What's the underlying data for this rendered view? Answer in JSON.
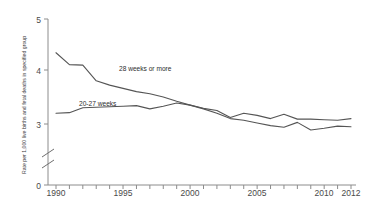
{
  "chart_data": {
    "type": "line",
    "title": "",
    "subtitle": "",
    "xlabel": "",
    "ylabel": "Rate per 1,000 live births and fetal deaths in specified group",
    "xlim": [
      1989,
      2012.6
    ],
    "ylim": [
      2.55,
      5.0
    ],
    "y_axis_break": true,
    "y_axis_break_between": [
      0,
      3
    ],
    "grid": false,
    "legend_position": "inline-annotations",
    "x_tick_labels": [
      "1990",
      "1995",
      "2000",
      "2005",
      "2010",
      "2012"
    ],
    "x_tick_values": [
      1990,
      1995,
      2000,
      2005,
      2010,
      2012
    ],
    "x_minor_ticks": [
      1989,
      1990,
      1991,
      1992,
      1993,
      1994,
      1995,
      1996,
      1997,
      1998,
      1999,
      2000,
      2001,
      2002,
      2003,
      2004,
      2005,
      2006,
      2007,
      2008,
      2009,
      2010,
      2011,
      2012
    ],
    "y_tick_labels": [
      "0",
      "3",
      "4",
      "5"
    ],
    "y_tick_values": [
      0,
      3,
      4,
      5
    ],
    "x": [
      1990,
      1991,
      1992,
      1993,
      1994,
      1995,
      1996,
      1997,
      1998,
      1999,
      2000,
      2001,
      2002,
      2003,
      2004,
      2005,
      2006,
      2007,
      2008,
      2009,
      2010,
      2011,
      2012
    ],
    "series": [
      {
        "name": "28 weeks or more",
        "label": "28 weeks or more",
        "color": "#555555",
        "values": [
          4.32,
          4.1,
          4.09,
          3.8,
          3.72,
          3.66,
          3.6,
          3.56,
          3.5,
          3.42,
          3.35,
          3.28,
          3.2,
          3.1,
          3.07,
          3.02,
          2.97,
          2.94,
          3.03,
          2.89,
          2.92,
          2.96,
          2.95
        ]
      },
      {
        "name": "20-27 weeks",
        "label": "20-27 weeks",
        "color": "#555555",
        "values": [
          3.2,
          3.21,
          3.3,
          3.31,
          3.32,
          3.33,
          3.34,
          3.28,
          3.33,
          3.39,
          3.35,
          3.29,
          3.25,
          3.12,
          3.2,
          3.16,
          3.1,
          3.18,
          3.09,
          3.09,
          3.08,
          3.07,
          3.1
        ]
      }
    ],
    "annotations": [
      {
        "text": "28 weeks or more",
        "x_px": 119,
        "y_px": 71
      },
      {
        "text": "20-27 weeks",
        "x_px": 79,
        "y_px": 106
      }
    ]
  },
  "axis": {
    "y_label": "Rate per 1,000 live births and fetal deaths in specified group",
    "tick_0": "0",
    "tick_3": "3",
    "tick_4": "4",
    "tick_5": "5",
    "x_1990": "1990",
    "x_1995": "1995",
    "x_2000": "2000",
    "x_2005": "2005",
    "x_2010": "2010",
    "x_2012": "2012"
  },
  "labels": {
    "series_a": "28 weeks or more",
    "series_b": "20-27 weeks"
  }
}
